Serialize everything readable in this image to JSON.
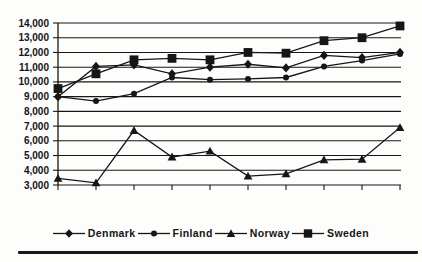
{
  "figure": {
    "background": "#fdfdfc",
    "ink_color": "#161616",
    "plot": {
      "left": 58,
      "right": 400,
      "top": 23,
      "bottom": 185
    }
  },
  "chart_data": {
    "type": "line",
    "title": "",
    "xlabel": "",
    "ylabel": "",
    "ylim": [
      3000,
      14000
    ],
    "ytick_step": 1000,
    "ytick_label_format": "comma",
    "x_count": 10,
    "x_tick_labels_visible": false,
    "grid": "horizontal",
    "legend_position": "bottom",
    "series": [
      {
        "name": "Denmark",
        "marker": "diamond",
        "values": [
          9000,
          11050,
          11150,
          10550,
          11000,
          11200,
          10950,
          11800,
          11650,
          12000
        ]
      },
      {
        "name": "Finland",
        "marker": "circle",
        "values": [
          9000,
          8700,
          9200,
          10300,
          10150,
          10200,
          10300,
          11050,
          11450,
          11900
        ]
      },
      {
        "name": "Norway",
        "marker": "triangle",
        "values": [
          3450,
          3150,
          6700,
          4900,
          5300,
          3600,
          3750,
          4700,
          4750,
          6900
        ]
      },
      {
        "name": "Sweden",
        "marker": "square",
        "values": [
          9550,
          10550,
          11500,
          11600,
          11500,
          12000,
          11950,
          12800,
          13000,
          13800
        ]
      }
    ]
  }
}
